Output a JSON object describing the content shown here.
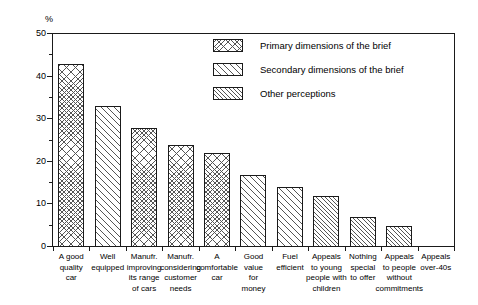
{
  "chart_data": {
    "type": "bar",
    "title": "",
    "xlabel": "",
    "ylabel": "%",
    "ylim": [
      0,
      50
    ],
    "y_ticks_major": [
      0,
      10,
      20,
      30,
      40,
      50
    ],
    "y_ticks_minor": [
      5,
      15,
      25,
      35,
      45
    ],
    "grid": false,
    "legend_position": "top-right",
    "categories": [
      "A good quality car",
      "Well equipped",
      "Manufr. improving its range of cars",
      "Manufr. considering customer needs",
      "A comfortable car",
      "Good value for money",
      "Fuel efficient",
      "Appeals to young people with children",
      "Nothing special to offer",
      "Appeals to people without commitments",
      "Appeals over-40s"
    ],
    "category_label_lines": [
      [
        "A good",
        "quality",
        "car"
      ],
      [
        "Well",
        "equipped"
      ],
      [
        "Manufr.",
        "improving",
        "its range",
        "of cars"
      ],
      [
        "Manufr.",
        "considering",
        "customer",
        "needs"
      ],
      [
        "A",
        "comfortable",
        "car"
      ],
      [
        "Good",
        "value",
        "for",
        "money"
      ],
      [
        "Fuel",
        "efficient"
      ],
      [
        "Appeals",
        "to young",
        "people with",
        "children"
      ],
      [
        "Nothing",
        "special",
        "to offer"
      ],
      [
        "Appeals",
        "to people",
        "without",
        "commitments"
      ],
      [
        "Appeals",
        "over-40s"
      ]
    ],
    "values": [
      43,
      33,
      28,
      24,
      22,
      17,
      14,
      12,
      7,
      5,
      0
    ],
    "series_group": [
      "primary",
      "secondary",
      "primary",
      "primary",
      "primary",
      "secondary",
      "secondary",
      "other",
      "other",
      "other",
      "other"
    ],
    "legend": [
      {
        "key": "primary",
        "label": "Primary dimensions of the brief",
        "pattern": "cross-hatch"
      },
      {
        "key": "secondary",
        "label": "Secondary dimensions of the brief",
        "pattern": "diagonal-wide"
      },
      {
        "key": "other",
        "label": "Other perceptions",
        "pattern": "diagonal-narrow"
      }
    ]
  },
  "colors": {
    "axis": "#1a1a1a",
    "hatch": "#555555",
    "background": "#ffffff",
    "bar_fill": "#ffffff"
  }
}
